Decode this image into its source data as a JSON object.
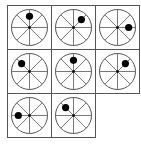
{
  "puzzle": {
    "type": "wheel-dot-sequence",
    "grid": {
      "rows": 3,
      "cols": 3,
      "origin_x": 7,
      "origin_y": 5,
      "cell_size": 44
    },
    "colors": {
      "line": "#555555",
      "dot": "#000000",
      "background": "#ffffff"
    },
    "wheel": {
      "radius": 18,
      "spokes": 8,
      "dot_radius": 3.6,
      "hub_radius": 1.3,
      "dot_distance": 0.62
    },
    "cells": [
      {
        "row": 0,
        "col": 0,
        "dot_angle_deg": 0
      },
      {
        "row": 0,
        "col": 1,
        "dot_angle_deg": 45
      },
      {
        "row": 0,
        "col": 2,
        "dot_angle_deg": 90
      },
      {
        "row": 1,
        "col": 0,
        "dot_angle_deg": 315
      },
      {
        "row": 1,
        "col": 1,
        "dot_angle_deg": 0
      },
      {
        "row": 1,
        "col": 2,
        "dot_angle_deg": 45
      },
      {
        "row": 2,
        "col": 0,
        "dot_angle_deg": 270
      },
      {
        "row": 2,
        "col": 1,
        "dot_angle_deg": 315
      }
    ],
    "missing_cell": {
      "row": 2,
      "col": 2
    }
  }
}
